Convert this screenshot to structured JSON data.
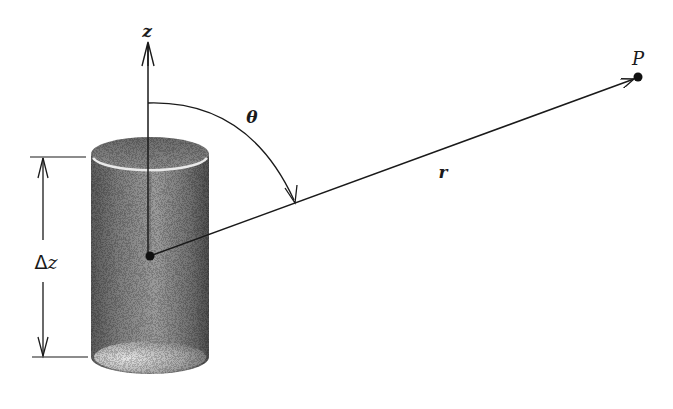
{
  "figure": {
    "colors": {
      "ink": "#1a1a1a",
      "cylinder_dark": "#4a4a4a",
      "cylinder_mid": "#8a8a8a",
      "cylinder_light": "#d8d8d8",
      "background": "#ffffff"
    }
  },
  "labels": {
    "z_axis": "z",
    "theta": "θ",
    "r": "r",
    "point": "P",
    "height_delta": "Δ",
    "height_var": "z"
  },
  "geometry": {
    "z_axis": {
      "x": 148,
      "y_top": 42,
      "y_bottom": 256
    },
    "origin_dot": {
      "x": 150,
      "y": 256
    },
    "point_P": {
      "x": 638,
      "y": 77
    },
    "cylinder": {
      "left": 91,
      "right": 209,
      "top_y": 154,
      "bottom_y": 357,
      "ellipse_ry": 17
    },
    "dimension_line": {
      "x": 43,
      "y_top": 157,
      "y_bottom": 357
    },
    "angle_arc": {
      "from": [
        150,
        103
      ],
      "to": [
        296,
        204
      ]
    }
  }
}
